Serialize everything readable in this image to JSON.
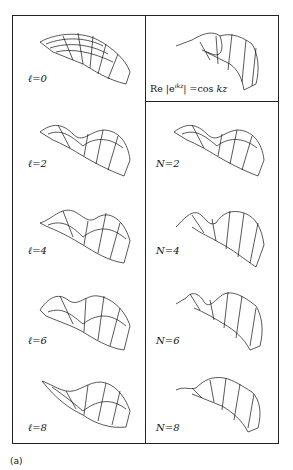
{
  "figure": {
    "caption": "(a)",
    "left_column": {
      "panels": [
        {
          "label": "ℓ=0"
        },
        {
          "label": "ℓ=2"
        },
        {
          "label": "ℓ=4"
        },
        {
          "label": "ℓ=6"
        },
        {
          "label": "ℓ=8"
        }
      ]
    },
    "right_column": {
      "header_panel": {
        "label": "Re {e^ikz} = cos kz",
        "label_display": "Re |e ikz| =cos kz"
      },
      "panels": [
        {
          "label": "N=2"
        },
        {
          "label": "N=4"
        },
        {
          "label": "N=6"
        },
        {
          "label": "N=8"
        }
      ]
    }
  }
}
